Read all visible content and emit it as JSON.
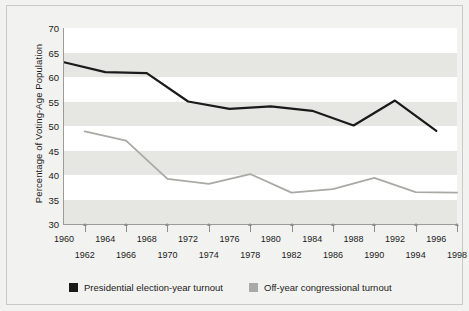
{
  "chart_data": {
    "type": "line",
    "title": "",
    "subtitle": "",
    "xlabel": "",
    "ylabel": "Percentage of Voting-Age Population",
    "ylim": [
      30,
      70
    ],
    "ytick_values": [
      30,
      35,
      40,
      45,
      50,
      55,
      60,
      65,
      70
    ],
    "ytick_labels": [
      "30",
      "35",
      "40",
      "45",
      "50",
      "55",
      "60",
      "65",
      "70"
    ],
    "xlim": [
      1960,
      1998
    ],
    "xtick_labels_top": [
      "1960",
      "1964",
      "1968",
      "1972",
      "1976",
      "1980",
      "1984",
      "1988",
      "1992",
      "1996"
    ],
    "xtick_labels_bottom": [
      "1962",
      "1966",
      "1970",
      "1974",
      "1978",
      "1982",
      "1986",
      "1990",
      "1994",
      "1998"
    ],
    "grid": "horizontal-bands",
    "legend_position": "bottom-left",
    "series": [
      {
        "name": "Presidential election-year turnout",
        "color": "#1a1a1a",
        "x": [
          1960,
          1964,
          1968,
          1972,
          1976,
          1980,
          1984,
          1988,
          1992,
          1996
        ],
        "values": [
          63.0,
          61.0,
          60.8,
          55.0,
          53.5,
          54.0,
          53.1,
          50.1,
          55.2,
          49.0
        ]
      },
      {
        "name": "Off-year congressional turnout",
        "color": "#a9a9a6",
        "x": [
          1962,
          1966,
          1970,
          1974,
          1978,
          1982,
          1986,
          1990,
          1994,
          1998
        ],
        "values": [
          48.9,
          47.0,
          39.2,
          38.2,
          40.2,
          36.4,
          37.1,
          39.4,
          36.5,
          36.4
        ]
      }
    ]
  },
  "legend": {
    "items": [
      {
        "label": "Presidential election-year turnout",
        "color": "#1a1a1a"
      },
      {
        "label": "Off-year congressional turnout",
        "color": "#a9a9a6"
      }
    ]
  }
}
